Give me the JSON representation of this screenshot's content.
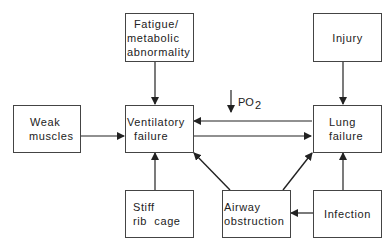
{
  "diagram": {
    "nodes": {
      "fatigue": {
        "lines": [
          "Fatigue/",
          "metabolic",
          "abnormality"
        ]
      },
      "injury": {
        "lines": [
          "Injury"
        ]
      },
      "weak_muscles": {
        "lines": [
          "Weak",
          "muscles"
        ]
      },
      "ventilatory_failure": {
        "lines": [
          "Ventilatory",
          "failure"
        ]
      },
      "lung_failure": {
        "lines": [
          "Lung",
          "failure"
        ]
      },
      "stiff_rib_cage": {
        "lines": [
          "Stiff",
          "rib  cage"
        ]
      },
      "airway_obstruction": {
        "lines": [
          "Airway",
          "obstruction"
        ]
      },
      "infection": {
        "lines": [
          "Infection"
        ]
      }
    },
    "edge_label": {
      "arrow": "↓",
      "text": "PO",
      "subscript": "2"
    },
    "edges": [
      {
        "from": "fatigue",
        "to": "ventilatory_failure"
      },
      {
        "from": "weak_muscles",
        "to": "ventilatory_failure"
      },
      {
        "from": "stiff_rib_cage",
        "to": "ventilatory_failure"
      },
      {
        "from": "airway_obstruction",
        "to": "ventilatory_failure"
      },
      {
        "from": "injury",
        "to": "lung_failure"
      },
      {
        "from": "infection",
        "to": "lung_failure"
      },
      {
        "from": "airway_obstruction",
        "to": "lung_failure"
      },
      {
        "from": "infection",
        "to": "airway_obstruction"
      },
      {
        "from": "lung_failure",
        "to": "ventilatory_failure",
        "label": "↓PO2"
      },
      {
        "from": "ventilatory_failure",
        "to": "lung_failure"
      }
    ],
    "colors": {
      "line": "#222222",
      "border": "#444444",
      "background": "#ffffff"
    }
  }
}
